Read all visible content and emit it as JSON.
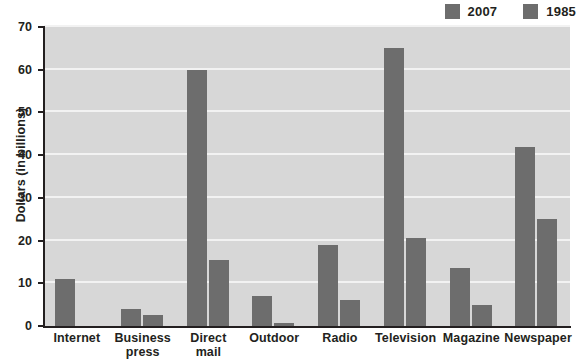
{
  "chart_data": {
    "type": "bar",
    "title": "",
    "subtitle": "",
    "xlabel": "",
    "ylabel": "Dollars (in billions)",
    "ylim": [
      0,
      70
    ],
    "yticks": [
      0,
      10,
      20,
      30,
      40,
      50,
      60,
      70
    ],
    "ytick_labels": [
      "0",
      "10",
      "20",
      "30",
      "40",
      "50",
      "60",
      "70"
    ],
    "grid": true,
    "legend_position": "top-right",
    "categories": [
      "Internet",
      "Business press",
      "Direct mail",
      "Outdoor",
      "Radio",
      "Television",
      "Magazine",
      "Newspaper"
    ],
    "category_lines": [
      [
        "Internet"
      ],
      [
        "Business",
        "press"
      ],
      [
        "Direct",
        "mail"
      ],
      [
        "Outdoor"
      ],
      [
        "Radio"
      ],
      [
        "Television"
      ],
      [
        "Magazine"
      ],
      [
        "Newspaper"
      ]
    ],
    "series": [
      {
        "name": "2007",
        "color": "#6d6d6d",
        "values": [
          11,
          4,
          60,
          7,
          19,
          65,
          13.5,
          42
        ]
      },
      {
        "name": "1985",
        "color": "#6d6d6d",
        "values": [
          0,
          2.5,
          15.5,
          0.8,
          6,
          20.5,
          5,
          25
        ]
      }
    ]
  },
  "style": {
    "plot_background": "#d7d7d7",
    "gridline_color": "#f2f2f2",
    "axis_color": "#231f20",
    "text_color": "#231f20",
    "page_background": "#ffffff"
  },
  "legend": {
    "items": [
      {
        "label": "2007",
        "color": "#6d6d6d"
      },
      {
        "label": "1985",
        "color": "#6d6d6d"
      }
    ]
  }
}
